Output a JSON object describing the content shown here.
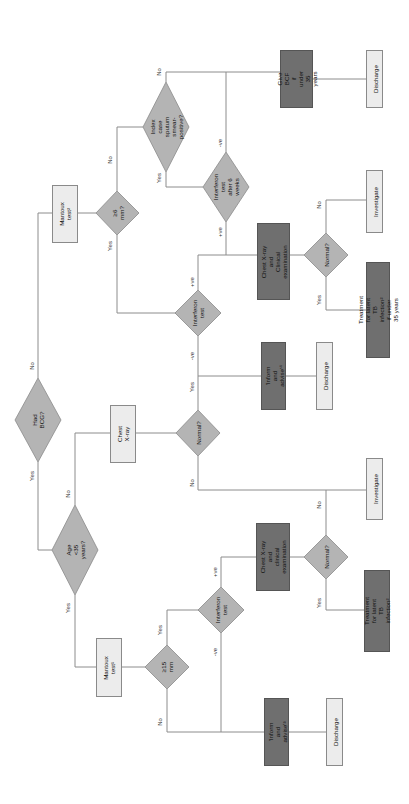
{
  "colors": {
    "line": "#8c8c8c",
    "diamond_fill": "#b4b4b4",
    "diamond_stroke": "#8a8a8a",
    "light_box": "#ececec",
    "dark_box": "#6f6f6f"
  },
  "flowchart": {
    "orientation": "rotated 90° counter-clockwise",
    "nodes": {
      "had_bcg": "Had BCG?",
      "age_35": "Age <35 years?",
      "mantoux_1": "Mantoux\ntest¹",
      "ge15": "≥15 mm",
      "interferon_bottom": "Interferon\ntest",
      "cxr_bottom": "Chest X-ray and\nclinical\nexamination",
      "normal_bottom": "Normal?",
      "treat_bottom": "Treatment for latent TB\ninfection²",
      "inform_bottom": "'Inform and\nadvise'³",
      "discharge_bottom": "Discharge",
      "investigate_mid": "Investigate",
      "chest_xray": "Chest\nX-ray",
      "normal_mid": "Normal?",
      "inform_mid": "'Inform and\nadvise'⁴",
      "discharge_mid": "Discharge",
      "mantoux_2": "Mantoux\ntest²",
      "ge6": "≥6 mm?",
      "interferon_mid": "Interferon\ntest",
      "cxr_top": "Chest X-ray and\nClinical\nexamination",
      "normal_top": "Normal?",
      "investigate_top": "Investigate",
      "treat_top": "Treatment for latent TB\ninfection² if under 35 years",
      "index_case": "Index case\nsputum smear-\npositive?",
      "interferon_6wk": "Interferon test\nafter 6 weeks",
      "give_bcf": "Give BCF\nif under\n35 years",
      "discharge_top": "Discharge"
    },
    "edge_labels": {
      "bcg_yes": "Yes",
      "bcg_no": "No",
      "age_yes": "Yes",
      "age_no": "No",
      "ge15_yes": "Yes",
      "ge15_no": "No",
      "ifn_bottom_pos": "+ve",
      "ifn_bottom_neg": "-ve",
      "normal_bottom_yes": "Yes",
      "normal_bottom_no": "No",
      "normal_mid_yes": "Yes",
      "normal_mid_no": "No",
      "ge6_yes": "Yes",
      "ge6_no": "No",
      "ifn_mid_pos": "+ve",
      "ifn_mid_neg": "-ve",
      "normal_top_yes": "Yes",
      "normal_top_no": "No",
      "index_yes": "Yes",
      "index_no": "No",
      "ifn6_pos": "+ve",
      "ifn6_neg": "-ve"
    }
  }
}
